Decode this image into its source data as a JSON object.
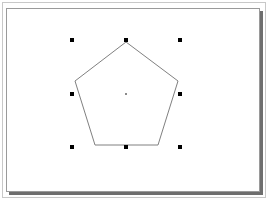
{
  "canvas": {
    "width": 271,
    "height": 203,
    "background": "#ffffff",
    "outer_border_color": "#c8c8c8",
    "page_border_color": "#9a9a9a",
    "page_shadow_color": "#6e6e6e"
  },
  "shape": {
    "type": "pentagon",
    "stroke": "#808080",
    "fill": "none",
    "points": "126,42 178,81 158,145 95,145 75,81",
    "center": {
      "x": 126,
      "y": 94,
      "color": "#8a8a8a"
    }
  },
  "selection": {
    "handle_color": "#000000",
    "handle_size": 4,
    "handles": [
      {
        "name": "top-left",
        "x": 72,
        "y": 40
      },
      {
        "name": "top-center",
        "x": 126,
        "y": 40
      },
      {
        "name": "top-right",
        "x": 180,
        "y": 40
      },
      {
        "name": "middle-left",
        "x": 72,
        "y": 94
      },
      {
        "name": "middle-right",
        "x": 180,
        "y": 94
      },
      {
        "name": "bottom-left",
        "x": 72,
        "y": 147
      },
      {
        "name": "bottom-center",
        "x": 126,
        "y": 147
      },
      {
        "name": "bottom-right",
        "x": 180,
        "y": 147
      }
    ]
  }
}
